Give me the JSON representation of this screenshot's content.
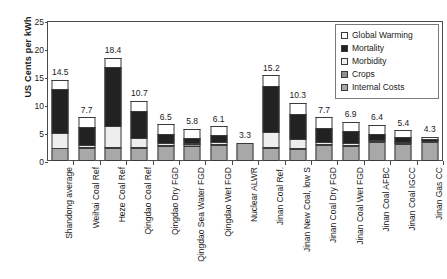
{
  "chart_data": {
    "type": "bar",
    "subtype": "stacked-bar",
    "title": "",
    "xlabel": "",
    "ylabel": "US Cents per kWh",
    "ylim": [
      0,
      25
    ],
    "yticks": [
      0,
      5,
      10,
      15,
      20,
      25
    ],
    "grid": false,
    "legend_position": "top-right",
    "categories": [
      "Shandong average",
      "Weihai Coal Ref",
      "Heze Coal Ref",
      "Qingdao Coal Ref",
      "Qingdao Dry FGD",
      "Qingdao Sea Water FGD",
      "Qingdao Wet FGD",
      "Nuclear ALWR",
      "Jinan Coal Ref.",
      "Jinan New Coal, low S",
      "Jinan Coal Dry FGD",
      "Jinan Coal Wet FGD",
      "Jinan Coal AFBC",
      "Jinan Coal IGCC",
      "Jinan Gas CC"
    ],
    "series": [
      {
        "name": "Internal Costs",
        "color": "#a8a8a8",
        "values": [
          2.3,
          2.3,
          2.3,
          2.3,
          2.6,
          2.6,
          2.8,
          3.3,
          2.3,
          2.2,
          2.8,
          2.7,
          3.4,
          3.1,
          3.4
        ]
      },
      {
        "name": "Crops",
        "color": "#8f8f8f",
        "values": [
          0.0,
          0.1,
          0.1,
          0.1,
          0.1,
          0.4,
          0.1,
          0.0,
          0.1,
          0.1,
          0.1,
          0.1,
          0.1,
          0.1,
          0.0
        ]
      },
      {
        "name": "Morbidity",
        "color": "#eeeeee",
        "values": [
          2.7,
          0.3,
          3.8,
          1.6,
          0.5,
          0.3,
          0.4,
          0.0,
          2.7,
          1.5,
          0.4,
          0.3,
          0.2,
          0.2,
          0.1
        ]
      },
      {
        "name": "Mortality",
        "color": "#222222",
        "values": [
          7.8,
          3.3,
          10.5,
          4.9,
          1.6,
          0.9,
          1.2,
          0.0,
          8.3,
          4.6,
          2.6,
          2.1,
          1.0,
          0.9,
          0.3
        ]
      },
      {
        "name": "Global Warming",
        "color": "#ffffff",
        "values": [
          1.7,
          1.7,
          1.7,
          1.8,
          1.7,
          1.6,
          1.6,
          0.0,
          1.8,
          1.9,
          1.8,
          1.7,
          1.7,
          1.1,
          0.5
        ]
      }
    ],
    "totals": [
      14.5,
      7.7,
      18.4,
      10.7,
      6.5,
      5.8,
      6.1,
      3.3,
      15.2,
      10.3,
      7.7,
      6.9,
      6.4,
      5.4,
      4.3
    ],
    "total_labels": [
      "14.5",
      "7.7",
      "18.4",
      "10.7",
      "6.5",
      "5.8",
      "6.1",
      "3.3",
      "15.2",
      "10.3",
      "7.7",
      "6.9",
      "6.4",
      "5.4",
      "4.3"
    ]
  },
  "axis": {
    "y_title": "US Cents per kWh",
    "y_tick_labels": [
      "0",
      "5",
      "10",
      "15",
      "20",
      "25"
    ]
  },
  "legend": {
    "items": [
      {
        "label": "Global Warming",
        "color": "#ffffff"
      },
      {
        "label": "Mortality",
        "color": "#222222"
      },
      {
        "label": "Morbidity",
        "color": "#eeeeee"
      },
      {
        "label": "Crops",
        "color": "#8f8f8f"
      },
      {
        "label": "Internal Costs",
        "color": "#a8a8a8"
      }
    ]
  }
}
